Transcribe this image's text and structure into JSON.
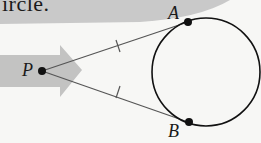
{
  "heading": {
    "text_fragment": "ircle."
  },
  "figure": {
    "points": [
      {
        "id": "P",
        "label": "P"
      },
      {
        "id": "A",
        "label": "A"
      },
      {
        "id": "B",
        "label": "B"
      }
    ],
    "segments": [
      {
        "from": "P",
        "to": "A",
        "tick_marks": 1
      },
      {
        "from": "P",
        "to": "B",
        "tick_marks": 1
      }
    ],
    "circle": {
      "tangent_points": [
        "A",
        "B"
      ]
    },
    "colors": {
      "arrow": "#bdbdbd",
      "banner": "#c8c8c8",
      "line": "#555555",
      "ink": "#111111",
      "background": "#f7f7f5"
    }
  }
}
